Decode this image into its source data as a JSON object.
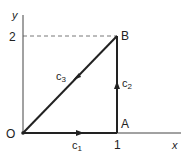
{
  "diagram": {
    "axes": {
      "x_label": "x",
      "y_label": "y"
    },
    "ticks": {
      "x_tick": "1",
      "y_tick": "2"
    },
    "points": {
      "origin": "O",
      "a": "A",
      "b": "B"
    },
    "paths": [
      {
        "id": "c1",
        "label": "c",
        "subscript": "1",
        "from": "O",
        "to": "A"
      },
      {
        "id": "c2",
        "label": "c",
        "subscript": "2",
        "from": "A",
        "to": "B"
      },
      {
        "id": "c3",
        "label": "c",
        "subscript": "3",
        "from": "B",
        "to": "O"
      }
    ],
    "colors": {
      "line": "#222222",
      "background": "#ffffff"
    }
  }
}
